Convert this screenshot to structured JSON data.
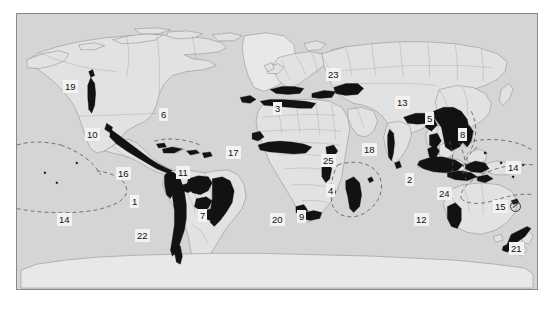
{
  "figure": {
    "type": "map",
    "kind": "world-map-thematic",
    "title": "",
    "projection": "pseudocylindrical world projection",
    "background_color": "#ffffff",
    "land_color": "#d5d5d5",
    "ocean_color": "#d5d5d5",
    "hotspot_fill_color": "#111111",
    "border_color": "#8a8a8a",
    "frame": {
      "left": 16,
      "top": 13,
      "width": 522,
      "height": 277
    }
  },
  "legend": {
    "label_box_fill": "#f2f2f2",
    "label_text_color": "#111111",
    "dashed_boundary_color": "#5a5a5a"
  },
  "hotspot_labels": [
    {
      "id": "label-19",
      "text": "19",
      "x": 62,
      "y": 79,
      "region_hint": "western-north-america"
    },
    {
      "id": "label-6",
      "text": "6",
      "x": 158,
      "y": 107,
      "region_hint": "caribbean"
    },
    {
      "id": "label-10",
      "text": "10",
      "x": 84,
      "y": 127,
      "region_hint": "mesoamerica"
    },
    {
      "id": "label-16",
      "text": "16",
      "x": 115,
      "y": 166,
      "region_hint": "tumbes-choco-magdalena"
    },
    {
      "id": "label-1",
      "text": "1",
      "x": 129,
      "y": 194,
      "region_hint": "tropical-andes"
    },
    {
      "id": "label-11",
      "text": "11",
      "x": 175,
      "y": 165,
      "region_hint": "cerrado"
    },
    {
      "id": "label-7",
      "text": "7",
      "x": 197,
      "y": 208,
      "region_hint": "atlantic-forest"
    },
    {
      "id": "label-22",
      "text": "22",
      "x": 134,
      "y": 228,
      "region_hint": "chilean-winter-rainfall"
    },
    {
      "id": "label-14-west",
      "text": "14",
      "x": 56,
      "y": 212,
      "region_hint": "polynesia-micronesia-west"
    },
    {
      "id": "label-3",
      "text": "3",
      "x": 272,
      "y": 101,
      "region_hint": "mediterranean-basin"
    },
    {
      "id": "label-23",
      "text": "23",
      "x": 325,
      "y": 67,
      "region_hint": "caucasus"
    },
    {
      "id": "label-17",
      "text": "17",
      "x": 225,
      "y": 145,
      "region_hint": "guinean-forests-west-africa"
    },
    {
      "id": "label-25",
      "text": "25",
      "x": 320,
      "y": 153,
      "region_hint": "eastern-afromontane"
    },
    {
      "id": "label-4",
      "text": "4",
      "x": 325,
      "y": 183,
      "region_hint": "madagascar-indian-ocean-islands"
    },
    {
      "id": "label-20",
      "text": "20",
      "x": 269,
      "y": 212,
      "region_hint": "succulent-karoo"
    },
    {
      "id": "label-9",
      "text": "9",
      "x": 296,
      "y": 209,
      "region_hint": "cape-floristic-region"
    },
    {
      "id": "label-18",
      "text": "18",
      "x": 361,
      "y": 142,
      "region_hint": "western-ghats-sri-lanka"
    },
    {
      "id": "label-13",
      "text": "13",
      "x": 394,
      "y": 95,
      "region_hint": "himalaya"
    },
    {
      "id": "label-5",
      "text": "5",
      "x": 424,
      "y": 111,
      "region_hint": "indo-burma"
    },
    {
      "id": "label-8",
      "text": "8",
      "x": 457,
      "y": 127,
      "region_hint": "philippines"
    },
    {
      "id": "label-2",
      "text": "2",
      "x": 404,
      "y": 172,
      "region_hint": "sundaland"
    },
    {
      "id": "label-24",
      "text": "24",
      "x": 436,
      "y": 186,
      "region_hint": "wallacea"
    },
    {
      "id": "label-12",
      "text": "12",
      "x": 413,
      "y": 212,
      "region_hint": "southwest-australia"
    },
    {
      "id": "label-14-east",
      "text": "14",
      "x": 505,
      "y": 160,
      "region_hint": "polynesia-micronesia-east"
    },
    {
      "id": "label-15",
      "text": "15",
      "x": 492,
      "y": 199,
      "region_hint": "new-caledonia"
    },
    {
      "id": "label-21",
      "text": "21",
      "x": 508,
      "y": 241,
      "region_hint": "new-zealand"
    }
  ],
  "marker_glyphs": [
    {
      "id": "glyph-15",
      "name": "circled-slash-marker",
      "x": 509,
      "y": 199
    }
  ]
}
